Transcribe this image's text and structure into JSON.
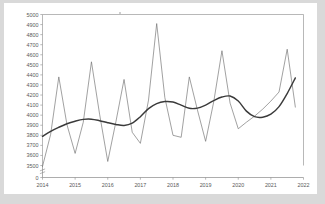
{
  "chart_data": {
    "type": "line",
    "title": "",
    "subtitle": "",
    "xlabel": "",
    "ylabel": "",
    "xlim": [
      2014.0,
      2022.0
    ],
    "ylim": [
      3500,
      5000
    ],
    "y_axis_break_to_zero": true,
    "grid": false,
    "legend_position": "none",
    "x_tick_labels": [
      "2014",
      "2015",
      "2016",
      "2017",
      "2018",
      "2019",
      "2020",
      "2021",
      "2022"
    ],
    "x_tick_values": [
      2014,
      2015,
      2016,
      2017,
      2018,
      2019,
      2020,
      2021,
      2022
    ],
    "y_tick_labels": [
      "0",
      "3500",
      "3600",
      "3700",
      "3800",
      "3900",
      "4000",
      "4100",
      "4200",
      "4300",
      "4400",
      "4500",
      "4600",
      "4700",
      "4800",
      "4900",
      "5000"
    ],
    "y_tick_values": [
      0,
      3500,
      3600,
      3700,
      3800,
      3900,
      4000,
      4100,
      4200,
      4300,
      4400,
      4500,
      4600,
      4700,
      4800,
      4900,
      5000
    ],
    "x": [
      2014.0,
      2014.25,
      2014.5,
      2014.75,
      2015.0,
      2015.25,
      2015.5,
      2015.75,
      2016.0,
      2016.25,
      2016.5,
      2016.75,
      2017.0,
      2017.25,
      2017.5,
      2017.75,
      2018.0,
      2018.25,
      2018.5,
      2018.75,
      2019.0,
      2019.25,
      2019.5,
      2019.75,
      2020.0,
      2020.25,
      2020.5,
      2020.75,
      2021.0,
      2021.25,
      2021.5,
      2021.75
    ],
    "series": [
      {
        "name": "observed",
        "style": "thin-zigzag",
        "color": "#6e6e6e",
        "values": [
          3490,
          3810,
          4380,
          3905,
          3620,
          3930,
          4530,
          4010,
          3540,
          3935,
          4355,
          3830,
          3720,
          4150,
          4910,
          4175,
          3800,
          3780,
          4380,
          4050,
          3740,
          4135,
          4640,
          4120,
          3865,
          3930,
          3990,
          4060,
          4140,
          4230,
          4655,
          4080
        ]
      },
      {
        "name": "trend",
        "style": "thick-smooth",
        "color": "#3a3a3a",
        "values": [
          3790,
          3840,
          3880,
          3915,
          3940,
          3958,
          3960,
          3945,
          3925,
          3908,
          3898,
          3920,
          3985,
          4065,
          4115,
          4135,
          4130,
          4100,
          4068,
          4070,
          4100,
          4145,
          4180,
          4190,
          4140,
          4040,
          3985,
          3980,
          4010,
          4085,
          4215,
          4370
        ]
      }
    ]
  },
  "figure": {
    "background_color": "#d9d9d9",
    "card_color": "#ffffff",
    "axis_color": "#8a8a8a",
    "frame_color": "#9a9a9a"
  }
}
